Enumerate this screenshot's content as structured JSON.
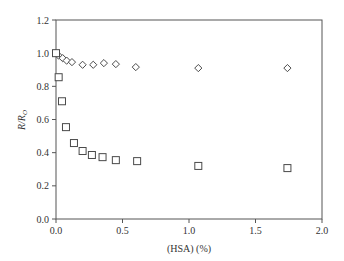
{
  "chart_data": {
    "type": "scatter",
    "title": "",
    "xlabel": "(HSA) (%)",
    "ylabel": "R/R_O",
    "ylabel_parts": {
      "main": "R/R",
      "sub": "O"
    },
    "xlim": [
      0.0,
      2.0
    ],
    "ylim": [
      0.0,
      1.2
    ],
    "xticks": [
      "0.0",
      "0.5",
      "1.0",
      "1.5",
      "2.0"
    ],
    "yticks": [
      "0.0",
      "0.2",
      "0.4",
      "0.6",
      "0.8",
      "1.0",
      "1.2"
    ],
    "grid": false,
    "legend": null,
    "frame": "box",
    "series": [
      {
        "name": "diamonds",
        "marker": "diamond",
        "x": [
          0.0,
          0.02,
          0.05,
          0.08,
          0.12,
          0.2,
          0.28,
          0.36,
          0.45,
          0.6,
          1.07,
          1.74
        ],
        "y": [
          1.0,
          0.985,
          0.97,
          0.955,
          0.946,
          0.93,
          0.93,
          0.94,
          0.934,
          0.916,
          0.91,
          0.91
        ]
      },
      {
        "name": "squares",
        "marker": "square",
        "x": [
          0.0,
          0.02,
          0.045,
          0.075,
          0.135,
          0.2,
          0.27,
          0.35,
          0.45,
          0.61,
          1.07,
          1.74
        ],
        "y": [
          1.0,
          0.855,
          0.71,
          0.554,
          0.458,
          0.41,
          0.386,
          0.373,
          0.355,
          0.349,
          0.32,
          0.307
        ]
      }
    ]
  }
}
